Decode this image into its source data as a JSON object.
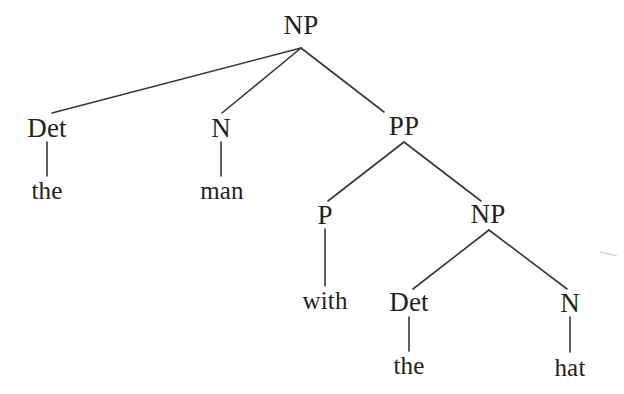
{
  "figure": {
    "kind": "constituency-syntax-tree",
    "sentence": "the man with the hat",
    "background_color": "#ffffff",
    "ink_color": "#231f20",
    "edge_color": "#3a3637",
    "width": 624,
    "height": 394
  },
  "nodes": {
    "root_np": {
      "label": "NP",
      "x": 301,
      "y": 25,
      "kind": "category"
    },
    "det1": {
      "label": "Det",
      "x": 47,
      "y": 128,
      "kind": "category"
    },
    "the1": {
      "label": "the",
      "x": 47,
      "y": 190,
      "kind": "leaf"
    },
    "n1": {
      "label": "N",
      "x": 221,
      "y": 128,
      "kind": "category"
    },
    "man": {
      "label": "man",
      "x": 222,
      "y": 190,
      "kind": "leaf"
    },
    "pp": {
      "label": "PP",
      "x": 404,
      "y": 126,
      "kind": "category"
    },
    "p": {
      "label": "P",
      "x": 325,
      "y": 215,
      "kind": "category"
    },
    "with": {
      "label": "with",
      "x": 325,
      "y": 300,
      "kind": "leaf"
    },
    "np2": {
      "label": "NP",
      "x": 488,
      "y": 214,
      "kind": "category"
    },
    "det2": {
      "label": "Det",
      "x": 409,
      "y": 302,
      "kind": "category"
    },
    "the2": {
      "label": "the",
      "x": 409,
      "y": 365,
      "kind": "leaf"
    },
    "n2": {
      "label": "N",
      "x": 570,
      "y": 303,
      "kind": "category"
    },
    "hat": {
      "label": "hat",
      "x": 570,
      "y": 367,
      "kind": "leaf"
    }
  },
  "edges": [
    {
      "name": "edge-root-np-to-det",
      "from": "root_np",
      "to": "det1",
      "x1": 301,
      "y1": 48,
      "x2": 52,
      "y2": 113
    },
    {
      "name": "edge-root-np-to-n",
      "from": "root_np",
      "to": "n1",
      "x1": 301,
      "y1": 48,
      "x2": 222,
      "y2": 113
    },
    {
      "name": "edge-root-np-to-pp",
      "from": "root_np",
      "to": "pp",
      "x1": 301,
      "y1": 48,
      "x2": 384,
      "y2": 112
    },
    {
      "name": "edge-det-to-the",
      "from": "det1",
      "to": "the1",
      "x1": 47,
      "y1": 142,
      "x2": 47,
      "y2": 176
    },
    {
      "name": "edge-n-to-man",
      "from": "n1",
      "to": "man",
      "x1": 221,
      "y1": 142,
      "x2": 221,
      "y2": 176
    },
    {
      "name": "edge-pp-to-p",
      "from": "pp",
      "to": "p",
      "x1": 404,
      "y1": 142,
      "x2": 328,
      "y2": 201
    },
    {
      "name": "edge-pp-to-np2",
      "from": "pp",
      "to": "np2",
      "x1": 404,
      "y1": 142,
      "x2": 481,
      "y2": 201
    },
    {
      "name": "edge-p-to-with",
      "from": "p",
      "to": "with",
      "x1": 325,
      "y1": 229,
      "x2": 325,
      "y2": 286
    },
    {
      "name": "edge-np2-to-det2",
      "from": "np2",
      "to": "det2",
      "x1": 489,
      "y1": 230,
      "x2": 413,
      "y2": 289
    },
    {
      "name": "edge-np2-to-n2",
      "from": "np2",
      "to": "n2",
      "x1": 489,
      "y1": 230,
      "x2": 567,
      "y2": 289
    },
    {
      "name": "edge-det2-to-the2",
      "from": "det2",
      "to": "the2",
      "x1": 409,
      "y1": 317,
      "x2": 409,
      "y2": 351
    },
    {
      "name": "edge-n2-to-hat",
      "from": "n2",
      "to": "hat",
      "x1": 570,
      "y1": 317,
      "x2": 570,
      "y2": 352
    }
  ],
  "artifacts": [
    {
      "name": "scan-artifact-mark",
      "x1": 600,
      "y1": 252,
      "x2": 617,
      "y2": 256,
      "color": "#d8d6d6"
    }
  ]
}
